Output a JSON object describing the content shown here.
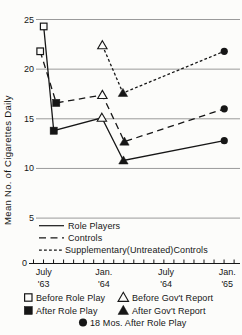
{
  "figure": {
    "background": "#fcfcfa",
    "ink_color": "#161616",
    "grid_color": "#8f8f8f"
  },
  "chart_data": {
    "type": "line",
    "title": "",
    "xlabel": "",
    "ylabel": "Mean No. of Cigarettes Daily",
    "ylim": [
      0,
      25
    ],
    "grid": "horizontal gridlines at ticks 5-25",
    "legend_position": "inside-bottom-left (line styles) and below-axis (markers)",
    "y_ticks": [
      25,
      20,
      15,
      10,
      5
    ],
    "axis_origin_label": "0",
    "x_tick_labels": [
      {
        "line1": "July",
        "line2": "'63",
        "month": 0
      },
      {
        "line1": "Jan.",
        "line2": "'64",
        "month": 6
      },
      {
        "line1": "July",
        "line2": "'64",
        "month": 12.2
      },
      {
        "line1": "Jan.",
        "line2": "'65",
        "month": 18.3
      }
    ],
    "x_unit": "months after July 1963, minor ticks monthly",
    "series": [
      {
        "name": "Role Players",
        "line_style": "solid",
        "points": [
          {
            "event": "Before Role Play",
            "month": 0,
            "value": 24.3,
            "marker": "open-square"
          },
          {
            "event": "After Role Play",
            "month": 1.0,
            "value": 13.8,
            "marker": "filled-square"
          },
          {
            "event": "Before Gov't Report",
            "month": 5.8,
            "value": 15.1,
            "marker": "open-triangle"
          },
          {
            "event": "After Gov't Report",
            "month": 7.95,
            "value": 10.8,
            "marker": "filled-triangle"
          },
          {
            "event": "18 Mos. After Role Play",
            "month": 18,
            "value": 12.8,
            "marker": "filled-circle"
          }
        ]
      },
      {
        "name": "Controls",
        "line_style": "long-dash",
        "points": [
          {
            "event": "Before Role Play",
            "month": -0.35,
            "value": 21.8,
            "marker": "open-square"
          },
          {
            "event": "After Role Play",
            "month": 1.25,
            "value": 16.6,
            "marker": "filled-square"
          },
          {
            "event": "Before Gov't Report",
            "month": 5.85,
            "value": 17.4,
            "marker": "open-triangle"
          },
          {
            "event": "After Gov't Report",
            "month": 8.05,
            "value": 12.7,
            "marker": "filled-triangle"
          },
          {
            "event": "18 Mos. After Role Play",
            "month": 18,
            "value": 16.0,
            "marker": "filled-circle"
          }
        ]
      },
      {
        "name": "Supplementary(Untreated)Controls",
        "line_style": "short-dash",
        "points": [
          {
            "event": "Before Gov't Report",
            "month": 5.85,
            "value": 22.4,
            "marker": "open-triangle"
          },
          {
            "event": "After Gov't Report",
            "month": 7.9,
            "value": 17.6,
            "marker": "filled-triangle"
          },
          {
            "event": "18 Mos. After Role Play",
            "month": 18,
            "value": 21.8,
            "marker": "filled-circle"
          }
        ]
      }
    ],
    "line_legend": [
      {
        "label": "Role Players",
        "style": "solid"
      },
      {
        "label": "Controls",
        "style": "long-dash"
      },
      {
        "label": "Supplementary(Untreated)Controls",
        "style": "short-dash"
      }
    ],
    "marker_legend": [
      {
        "marker": "open-square",
        "label": "Before Role Play"
      },
      {
        "marker": "filled-square",
        "label": "After Role Play"
      },
      {
        "marker": "open-triangle",
        "label": "Before Gov't Report"
      },
      {
        "marker": "filled-triangle",
        "label": "After Gov't Report"
      },
      {
        "marker": "filled-circle",
        "label": "18 Mos. After Role Play"
      }
    ]
  }
}
